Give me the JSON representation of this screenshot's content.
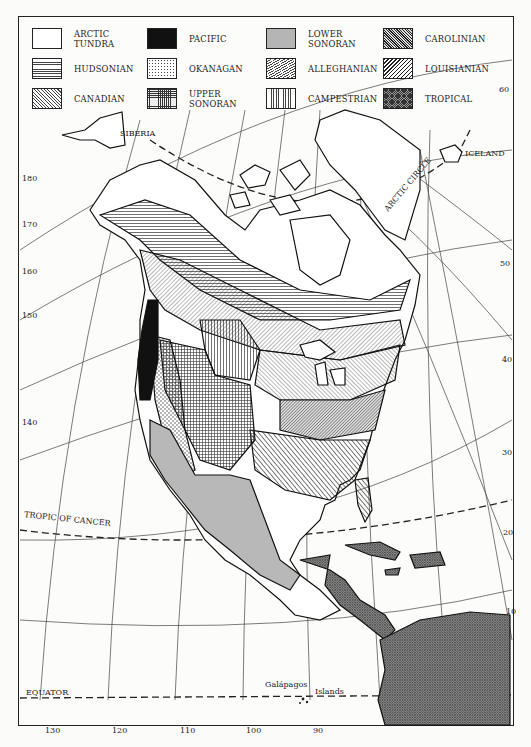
{
  "figure": {
    "legend": [
      {
        "label": "ARCTIC\nTUNDRA",
        "pattern": "blank",
        "col": 0,
        "row": 0
      },
      {
        "label": "HUDSONIAN",
        "pattern": "horizontal-lines",
        "col": 0,
        "row": 1
      },
      {
        "label": "CANADIAN",
        "pattern": "diagonal-fine",
        "col": 0,
        "row": 2
      },
      {
        "label": "PACIFIC",
        "pattern": "solid-black",
        "col": 1,
        "row": 0
      },
      {
        "label": "OKANAGAN",
        "pattern": "dots",
        "col": 1,
        "row": 1
      },
      {
        "label": "UPPER\nSONORAN",
        "pattern": "crosshatch-grid",
        "col": 1,
        "row": 2
      },
      {
        "label": "LOWER\nSONORAN",
        "pattern": "gray-solid",
        "col": 2,
        "row": 0
      },
      {
        "label": "ALLEGHANIAN",
        "pattern": "diagonal-reverse",
        "col": 2,
        "row": 1
      },
      {
        "label": "CAMPESTRIAN",
        "pattern": "vertical-lines",
        "col": 2,
        "row": 2
      },
      {
        "label": "CAROLINIAN",
        "pattern": "diagonal-dense",
        "col": 3,
        "row": 0
      },
      {
        "label": "LOUISIANIAN",
        "pattern": "diagonal-bold",
        "col": 3,
        "row": 1
      },
      {
        "label": "TROPICAL",
        "pattern": "crosshatch-dark",
        "col": 3,
        "row": 2
      }
    ],
    "place_labels": {
      "siberia": "SIBERIA",
      "iceland": "ICELAND",
      "arctic_circle": "ARCTIC CIRCLE",
      "tropic_of_cancer": "TROPIC OF CANCER",
      "equator": "EQUATOR",
      "galapagos": "Galápagos",
      "islands": "Islands"
    },
    "left_ticks": [
      "180",
      "170",
      "160",
      "150",
      "140"
    ],
    "right_ticks": [
      "60",
      "50",
      "40",
      "30",
      "20",
      "10"
    ],
    "bottom_ticks": [
      "130",
      "120",
      "110",
      "100",
      "90"
    ]
  }
}
